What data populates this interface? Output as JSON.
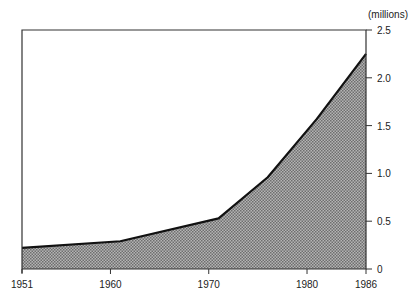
{
  "chart_data": {
    "type": "area",
    "title": "",
    "xlabel": "",
    "ylabel": "(millions)",
    "y_axis_position": "right",
    "x": [
      1951,
      1961,
      1971,
      1976,
      1981,
      1986
    ],
    "series": [
      {
        "name": "value",
        "values": [
          0.22,
          0.29,
          0.53,
          0.96,
          1.57,
          2.25
        ]
      }
    ],
    "xlim": [
      1951,
      1986
    ],
    "ylim": [
      0,
      2.5
    ],
    "x_ticks": [
      1951,
      1960,
      1970,
      1980,
      1986
    ],
    "x_tick_labels": [
      "1951",
      "1960",
      "1970",
      "1980",
      "1986"
    ],
    "y_ticks": [
      0,
      0.5,
      1.0,
      1.5,
      2.0,
      2.5
    ],
    "y_tick_labels": [
      "0",
      "0.5",
      "1.0",
      "1.5",
      "2.0",
      "2.5"
    ],
    "grid": false,
    "legend": null,
    "fill": "stippled grey",
    "colors": {
      "line": "#111111",
      "fill": "#9a9a9a",
      "axis": "#333333"
    }
  }
}
